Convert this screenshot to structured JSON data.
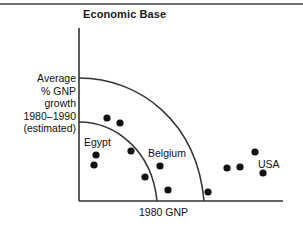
{
  "figure": {
    "title": "Economic Base",
    "has_top_rule": true
  },
  "axes": {
    "ylabel_lines": [
      "Average",
      "% GNP",
      "growth",
      "1980–1990",
      "(estimated)"
    ],
    "xlabel": "1980 GNP",
    "line_color": "#333333"
  },
  "annotations": [
    {
      "name": "egypt",
      "text": "Egypt",
      "x": 84,
      "y": 136
    },
    {
      "name": "belgium",
      "text": "Belgium",
      "x": 148,
      "y": 147
    },
    {
      "name": "usa",
      "text": "USA",
      "x": 258,
      "y": 158
    }
  ],
  "chart_data": {
    "type": "scatter",
    "title": "Economic Base",
    "xlabel": "1980 GNP",
    "ylabel": "Average % GNP growth 1980–1990 (estimated)",
    "grid": false,
    "legend": "none",
    "xlim": [
      0,
      100
    ],
    "ylim": [
      0,
      100
    ],
    "axis_origin_px": {
      "x": 79,
      "y": 201
    },
    "axis_extent_px": {
      "x_right": 283,
      "y_top": 28
    },
    "marker": {
      "shape": "circle",
      "color": "#111111",
      "radius_px": 3.6
    },
    "points": [
      {
        "px": 107,
        "py": 118,
        "x": 13.7,
        "y": 40.7
      },
      {
        "px": 120,
        "py": 123,
        "x": 20.1,
        "y": 45.1
      },
      {
        "px": 96,
        "py": 155,
        "x": 8.3,
        "y": 26.6
      },
      {
        "px": 94,
        "py": 165,
        "x": 7.4,
        "y": 20.8
      },
      {
        "px": 131,
        "py": 151,
        "x": 25.5,
        "y": 28.9
      },
      {
        "px": 160,
        "py": 166,
        "x": 39.7,
        "y": 20.2
      },
      {
        "px": 145,
        "py": 177,
        "x": 32.4,
        "y": 13.9
      },
      {
        "px": 168,
        "py": 190,
        "x": 43.6,
        "y": 6.4
      },
      {
        "px": 208,
        "py": 192,
        "x": 63.2,
        "y": 5.2
      },
      {
        "px": 227,
        "py": 168,
        "x": 72.5,
        "y": 19.1
      },
      {
        "px": 240,
        "py": 167,
        "x": 78.9,
        "y": 19.7
      },
      {
        "px": 255,
        "py": 152,
        "x": 86.3,
        "y": 28.3
      },
      {
        "px": 263,
        "py": 173,
        "x": 90.2,
        "y": 16.2
      }
    ],
    "arcs": [
      {
        "name": "inner-frontier-arc",
        "y_intercept_px": 122,
        "x_intercept_px": 157,
        "stroke": "#333333"
      },
      {
        "name": "outer-frontier-arc",
        "y_intercept_px": 78,
        "x_intercept_px": 204,
        "stroke": "#333333"
      }
    ]
  }
}
